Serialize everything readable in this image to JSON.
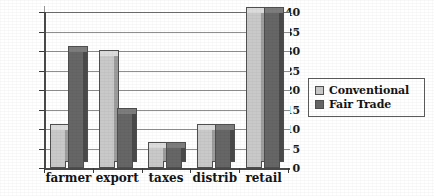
{
  "chart_data": {
    "type": "bar",
    "title": "",
    "subtitle": "",
    "xlabel": "",
    "ylabel": "",
    "categories": [
      "farmer",
      "export",
      "taxes",
      "distrib",
      "retail"
    ],
    "series": [
      {
        "name": "Conventional",
        "color": "#c9c9c9",
        "values": [
          10,
          29,
          5.5,
          10,
          40
        ]
      },
      {
        "name": "Fair Trade",
        "color": "#666666",
        "values": [
          30,
          14,
          5.5,
          10,
          40
        ]
      }
    ],
    "ylim": [
      0,
      40
    ],
    "ytick_values": [
      0,
      5,
      10,
      15,
      20,
      25,
      30,
      35,
      40
    ],
    "ytick_labels": [
      "0",
      "5",
      "10",
      "15",
      "20",
      "25",
      "30",
      "35",
      "40"
    ],
    "grid": true,
    "grid_axis": "y",
    "legend_position": "right",
    "style_3d": true,
    "background": "#ffffff",
    "axis_color": "#4a4a4a",
    "grid_color": "#8f8f8f"
  },
  "legend": {
    "items": [
      {
        "label": "Conventional",
        "swatch": "legend-swatch-conventional"
      },
      {
        "label": "Fair Trade",
        "swatch": "legend-swatch-fair-trade"
      }
    ]
  }
}
